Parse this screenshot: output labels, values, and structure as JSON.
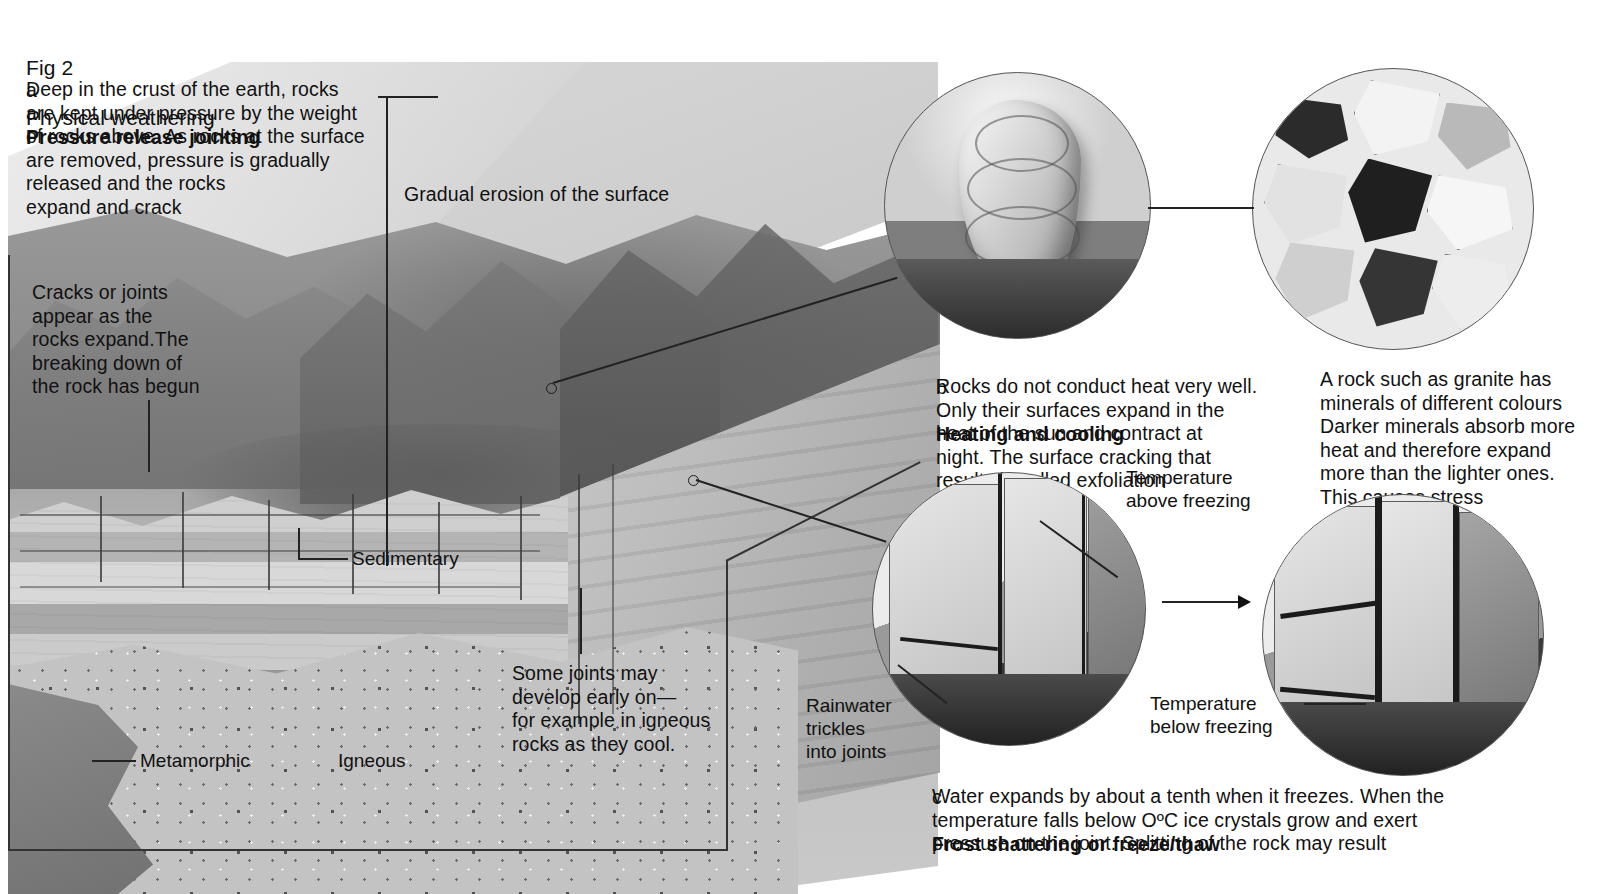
{
  "figure": {
    "number_label": "Fig 2",
    "title": "Physical weathering"
  },
  "sections": {
    "a": {
      "marker": "a",
      "heading": "Pressure release jointing",
      "body": "Deep in the crust of the earth, rocks\nare kept under pressure by the weight\nof rocks above. As rocks at the surface\nare removed, pressure is gradually\nreleased and the rocks\nexpand and crack"
    },
    "b": {
      "marker": "b",
      "heading": "Heating and cooling",
      "body": "Rocks do not conduct heat very well.\nOnly their surfaces expand in the\nheat of the sun and contract at\nnight. The surface cracking that\nresults is called exfoliation"
    },
    "c": {
      "marker": "c",
      "heading": "Frost shattering or freeze/thaw",
      "body": "Water expands by about a tenth when it freezes. When the\ntemperature falls below OºC ice crystals grow and exert\npressure on the joint. Splitting of the rock may result"
    }
  },
  "callouts": {
    "cracks_or_joints": "Cracks or joints\nappear as the\nrocks expand.The\nbreaking down of\nthe rock has begun",
    "gradual_erosion": "Gradual erosion of the surface",
    "sedimentary": "Sedimentary",
    "igneous": "Igneous",
    "metamorphic": "Metamorphic",
    "some_joints": "Some joints may\ndevelop early on—\nfor example in igneous\nrocks as they cool.",
    "granite_minerals": "A rock such as granite has\nminerals of different colours\nDarker minerals absorb more\nheat and therefore expand\nmore than the lighter ones.\nThis causes stress",
    "temperature_above": "Temperature\nabove freezing",
    "temperature_below": "Temperature\nbelow freezing",
    "rainwater": "Rainwater\ntrickles\ninto joints"
  },
  "colors": {
    "ink": "#111111",
    "paper": "#ffffff",
    "rock_mid": "#9a9a9a",
    "rock_dark": "#4f4f4f",
    "rock_light": "#d3d3d3"
  }
}
